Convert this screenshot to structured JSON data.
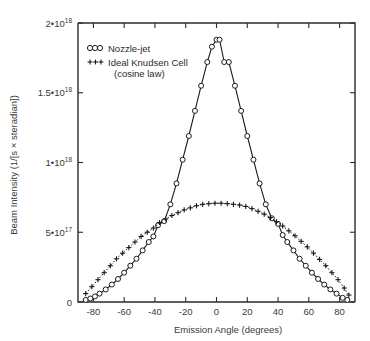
{
  "chart_data": {
    "type": "line",
    "title": "",
    "xlabel": "Emission Angle (degrees)",
    "ylabel": "Beam Intensity (1/[s × steradian])",
    "xlim": [
      -90,
      90
    ],
    "ylim": [
      0,
      2e+18
    ],
    "grid": false,
    "legend_position": "top-left",
    "xticks": [
      -80,
      -60,
      -40,
      -20,
      0,
      20,
      40,
      60,
      80
    ],
    "xticklabels": [
      "-80",
      "-60",
      "-40",
      "-20",
      "0",
      "20",
      "40",
      "60",
      "80"
    ],
    "yticks": [
      0,
      5e+17,
      1e+18,
      1.5e+18,
      2e+18
    ],
    "yticklabels": [
      "0",
      "5•10",
      "1•10",
      "1.5•10",
      "2•10"
    ],
    "ytick_exponents": [
      "",
      "17",
      "18",
      "18",
      "18"
    ],
    "series": [
      {
        "name": "Nozzle-jet",
        "marker": "circle",
        "linestyle": "solid",
        "x": [
          -85,
          -82,
          -79,
          -76,
          -72,
          -68,
          -64,
          -60,
          -56,
          -52,
          -48,
          -44,
          -41,
          -38,
          -34,
          -30,
          -26,
          -22,
          -18,
          -14,
          -10,
          -6,
          -3,
          0,
          2,
          5,
          8,
          12,
          16,
          20,
          24,
          28,
          32,
          36,
          40,
          43,
          46,
          50,
          54,
          58,
          62,
          66,
          70,
          74,
          78,
          82,
          85
        ],
        "y": [
          1.5e+16,
          2.5e+16,
          4e+16,
          6e+16,
          9e+16,
          1.25e+17,
          1.65e+17,
          2.1e+17,
          2.6e+17,
          3.1e+17,
          3.7e+17,
          4.3e+17,
          4.7e+17,
          5.5e+17,
          5.8e+17,
          7e+17,
          8.5e+17,
          1.02e+18,
          1.19e+18,
          1.37e+18,
          1.55e+18,
          1.72e+18,
          1.83e+18,
          1.88e+18,
          1.88e+18,
          1.72e+18,
          1.72e+18,
          1.55e+18,
          1.37e+18,
          1.19e+18,
          1.02e+18,
          8.5e+17,
          7e+17,
          6e+17,
          5.6e+17,
          4.8e+17,
          4.3e+17,
          3.7e+17,
          3.1e+17,
          2.6e+17,
          2.1e+17,
          1.65e+17,
          1.25e+17,
          9e+16,
          6e+16,
          3e+16,
          1.5e+16
        ]
      },
      {
        "name": "Ideal Knudsen Cell",
        "name_line2": "(cosine law)",
        "marker": "plus",
        "linestyle": "dotted",
        "x": [
          -85,
          -81,
          -77,
          -73,
          -69,
          -65,
          -61,
          -57,
          -53,
          -49,
          -45,
          -41,
          -37,
          -33,
          -29,
          -25,
          -21,
          -17,
          -13,
          -9,
          -5,
          -1,
          3,
          7,
          11,
          15,
          19,
          23,
          27,
          31,
          35,
          39,
          43,
          47,
          51,
          55,
          59,
          63,
          67,
          71,
          75,
          79,
          83,
          86
        ],
        "y": [
          6e+16,
          1.1e+17,
          1.6e+17,
          2.1e+17,
          2.6e+17,
          3.1e+17,
          3.5e+17,
          3.9e+17,
          4.3e+17,
          4.7e+17,
          5e+17,
          5.3e+17,
          5.7e+17,
          5.95e+17,
          6.2e+17,
          6.4e+17,
          6.6e+17,
          6.75e+17,
          6.9e+17,
          7e+17,
          7.05e+17,
          7.08e+17,
          7.08e+17,
          7.05e+17,
          7e+17,
          6.95e+17,
          6.85e+17,
          6.7e+17,
          6.5e+17,
          6.3e+17,
          6.05e+17,
          5.75e+17,
          5.45e+17,
          5.1e+17,
          4.75e+17,
          4.35e+17,
          3.95e+17,
          3.5e+17,
          3.05e+17,
          2.6e+17,
          2.1e+17,
          1.6e+17,
          1e+17,
          5e+16
        ]
      }
    ]
  },
  "legend": {
    "items": [
      {
        "label": "Nozzle-jet",
        "marker": "circle"
      },
      {
        "label": "Ideal Knudsen Cell",
        "label_line2": "(cosine law)",
        "marker": "plus"
      }
    ]
  },
  "colors": {
    "ink": "#1a1a1a",
    "axis": "#2b2b2b",
    "text": "#3a3a3a",
    "background": "#ffffff"
  }
}
